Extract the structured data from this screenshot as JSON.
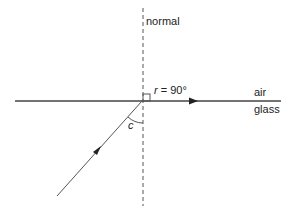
{
  "diagram": {
    "labels": {
      "normal": "normal",
      "refraction_angle": "r = 90°",
      "critical_angle": "c",
      "medium_top": "air",
      "medium_bottom": "glass"
    },
    "colors": {
      "line": "#333333",
      "background": "#ffffff"
    }
  }
}
